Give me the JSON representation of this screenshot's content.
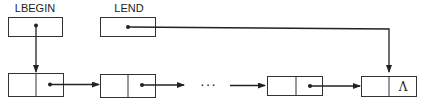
{
  "diagram": {
    "pointers": [
      {
        "label": "LBEGIN",
        "target": "first node"
      },
      {
        "label": "LEND",
        "target": "last node"
      }
    ],
    "nodes": [
      {
        "index": 1,
        "link": "pointer"
      },
      {
        "index": 2,
        "link": "pointer"
      },
      {
        "index": "n-1",
        "link": "pointer"
      },
      {
        "index": "n",
        "link": "Λ"
      }
    ],
    "ellipsis": "···",
    "null_symbol": "Λ",
    "colors": {
      "stroke": "#222222",
      "background": "#ffffff"
    }
  }
}
